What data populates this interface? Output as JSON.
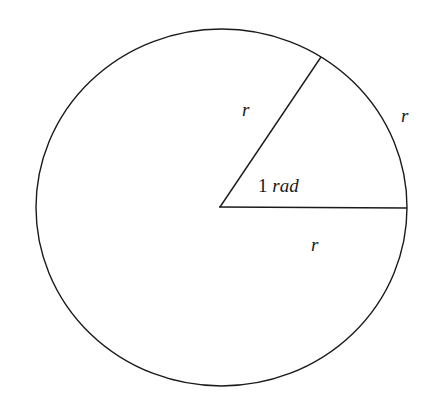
{
  "diagram": {
    "title": "",
    "stroke_color": "#1a1a1a",
    "background_color": "#ffffff",
    "circle": {
      "cx": 221.5,
      "cy": 207.5,
      "rx": 185.5,
      "ry": 178.5
    },
    "center_point": [
      220,
      207
    ],
    "radius_horizontal_end": [
      407,
      207
    ],
    "radius_angled_end": [
      321,
      57
    ],
    "labels": {
      "radius_angled": "r",
      "arc": "r",
      "radius_horizontal": "r",
      "angle_number": "1",
      "angle_unit": "rad"
    }
  }
}
